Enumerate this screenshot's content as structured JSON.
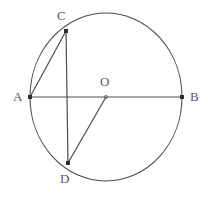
{
  "figure": {
    "type": "circle-geometry-diagram",
    "canvas": {
      "width": 208,
      "height": 201,
      "background": "#ffffff"
    },
    "stroke_color": "#4c4c4e",
    "label_color": "#59595b",
    "circle": {
      "name": "main-circle",
      "center_label": "O",
      "cx": 106,
      "cy": 97,
      "rx": 76,
      "ry": 84,
      "stroke_width": 1.1
    },
    "points": [
      {
        "id": "A",
        "label": "A",
        "x": 30,
        "y": 97,
        "label_x": 13,
        "label_y": 90,
        "marker": "filled-square",
        "marker_size": 4
      },
      {
        "id": "B",
        "label": "B",
        "x": 182,
        "y": 97,
        "label_x": 190,
        "label_y": 90,
        "marker": "filled-square",
        "marker_size": 4
      },
      {
        "id": "C",
        "label": "C",
        "x": 66,
        "y": 31,
        "label_x": 57,
        "label_y": 9,
        "marker": "filled-square",
        "marker_size": 4
      },
      {
        "id": "D",
        "label": "D",
        "x": 68,
        "y": 163,
        "label_x": 60,
        "label_y": 172,
        "marker": "filled-square",
        "marker_size": 4
      },
      {
        "id": "O",
        "label": "O",
        "x": 106,
        "y": 97,
        "label_x": 100,
        "label_y": 75,
        "marker": "small-dot",
        "marker_size": 2
      }
    ],
    "segments": [
      {
        "id": "AB",
        "name": "diameter-a-b",
        "from": "A",
        "to": "B",
        "x1": 30,
        "y1": 97,
        "x2": 182,
        "y2": 97
      },
      {
        "id": "AC",
        "name": "chord-a-c",
        "from": "A",
        "to": "C",
        "x1": 30,
        "y1": 97,
        "x2": 66,
        "y2": 31
      },
      {
        "id": "CD",
        "name": "chord-c-d",
        "from": "C",
        "to": "D",
        "x1": 66,
        "y1": 31,
        "x2": 68,
        "y2": 163
      },
      {
        "id": "OD",
        "name": "radius-o-d",
        "from": "O",
        "to": "D",
        "x1": 106,
        "y1": 97,
        "x2": 68,
        "y2": 163
      }
    ]
  }
}
